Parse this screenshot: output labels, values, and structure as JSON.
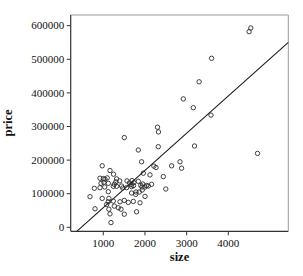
{
  "chart_data": {
    "type": "scatter",
    "title": "",
    "xlabel": "size",
    "ylabel": "price",
    "x_ticks": [
      1000,
      2000,
      3000,
      4000
    ],
    "y_ticks": [
      0,
      100000,
      200000,
      300000,
      400000,
      500000,
      600000
    ],
    "xlim": [
      218,
      5440
    ],
    "ylim": [
      -11900,
      631800
    ],
    "grid": false,
    "legend": "none",
    "marker": "open-circle",
    "regression_line": {
      "x1": 363,
      "y1": -11900,
      "x2": 5440,
      "y2": 550300,
      "slope": 110.7,
      "intercept": -52100
    },
    "colors": {
      "point_stroke": "#2b2b2b",
      "line_color": "#1a1a1a",
      "axis_color": "#333333",
      "box_color": "#999999",
      "text_color": "#111111",
      "background": "#ffffff"
    },
    "points": [
      [
        4500,
        582000
      ],
      [
        4540,
        593000
      ],
      [
        3600,
        503000
      ],
      [
        3300,
        433000
      ],
      [
        3160,
        356000
      ],
      [
        2920,
        382000
      ],
      [
        3585,
        334000
      ],
      [
        2300,
        298000
      ],
      [
        2325,
        284000
      ],
      [
        2320,
        240000
      ],
      [
        3190,
        242000
      ],
      [
        4700,
        220000
      ],
      [
        1505,
        267000
      ],
      [
        1840,
        230000
      ],
      [
        1920,
        195000
      ],
      [
        2215,
        182000
      ],
      [
        2265,
        178000
      ],
      [
        2640,
        183000
      ],
      [
        2840,
        195000
      ],
      [
        2880,
        176000
      ],
      [
        1960,
        161000
      ],
      [
        2120,
        156000
      ],
      [
        2440,
        151000
      ],
      [
        1160,
        169000
      ],
      [
        975,
        183000
      ],
      [
        1245,
        158000
      ],
      [
        1000,
        145000
      ],
      [
        1095,
        147000
      ],
      [
        920,
        146000
      ],
      [
        1040,
        143000
      ],
      [
        1320,
        144000
      ],
      [
        1395,
        138000
      ],
      [
        1570,
        138000
      ],
      [
        1630,
        132000
      ],
      [
        1690,
        139000
      ],
      [
        1665,
        127000
      ],
      [
        1735,
        133000
      ],
      [
        1725,
        124000
      ],
      [
        1840,
        137000
      ],
      [
        1900,
        125000
      ],
      [
        1300,
        135000
      ],
      [
        1015,
        134000
      ],
      [
        1120,
        131000
      ],
      [
        945,
        131000
      ],
      [
        1265,
        128000
      ],
      [
        2160,
        128000
      ],
      [
        1945,
        129000
      ],
      [
        1930,
        120000
      ],
      [
        2040,
        124000
      ],
      [
        2080,
        123000
      ],
      [
        1240,
        122000
      ],
      [
        1320,
        122000
      ],
      [
        1440,
        123000
      ],
      [
        1465,
        117000
      ],
      [
        1560,
        118000
      ],
      [
        1680,
        121000
      ],
      [
        2000,
        120000
      ],
      [
        1035,
        120000
      ],
      [
        920,
        118000
      ],
      [
        785,
        116000
      ],
      [
        2500,
        114000
      ],
      [
        1785,
        105000
      ],
      [
        1865,
        105000
      ],
      [
        1680,
        102000
      ],
      [
        1120,
        106000
      ],
      [
        1935,
        111000
      ],
      [
        1778,
        98000
      ],
      [
        2000,
        92000
      ],
      [
        680,
        91000
      ],
      [
        975,
        86000
      ],
      [
        1135,
        86000
      ],
      [
        1080,
        68000
      ],
      [
        1135,
        54000
      ],
      [
        800,
        55000
      ],
      [
        1880,
        73000
      ],
      [
        1120,
        76000
      ],
      [
        1240,
        78000
      ],
      [
        1400,
        76000
      ],
      [
        1505,
        80000
      ],
      [
        1600,
        74000
      ],
      [
        1720,
        77000
      ],
      [
        1264,
        63000
      ],
      [
        1360,
        58000
      ],
      [
        1425,
        54000
      ],
      [
        1160,
        40000
      ],
      [
        1505,
        39000
      ],
      [
        1185,
        14000
      ],
      [
        1800,
        46000
      ]
    ]
  }
}
